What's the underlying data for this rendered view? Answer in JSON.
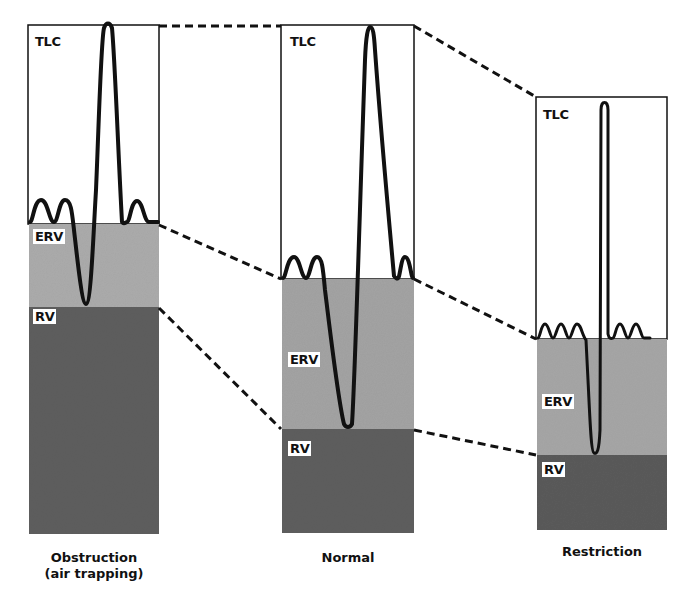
{
  "colors": {
    "tlc_fill": "#ffffff",
    "erv_fill": "#a9a9a9",
    "rv_fill": "#5c5c5c",
    "trace": "#111111"
  },
  "panels": [
    {
      "caption_line1": "Obstruction",
      "caption_line2": "(air trapping)",
      "labels": {
        "tlc": "TLC",
        "erv": "ERV",
        "rv": "RV"
      }
    },
    {
      "caption_line1": "Normal",
      "caption_line2": "",
      "labels": {
        "tlc": "TLC",
        "erv": "ERV",
        "rv": "RV"
      }
    },
    {
      "caption_line1": "Restriction",
      "caption_line2": "",
      "labels": {
        "tlc": "TLC",
        "erv": "ERV",
        "rv": "RV"
      }
    }
  ]
}
